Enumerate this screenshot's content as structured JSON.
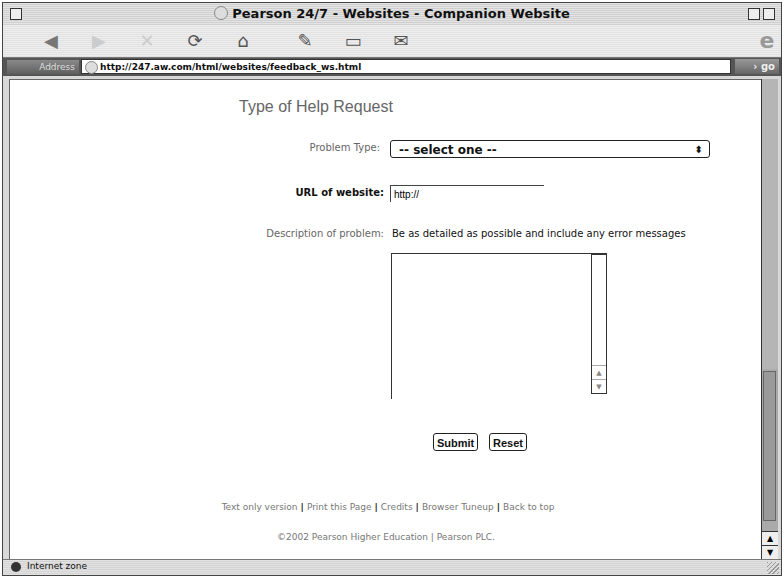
{
  "window": {
    "title": "Pearson 24/7 - Websites - Companion Website"
  },
  "toolbar": {
    "buttons": [
      {
        "name": "back",
        "icon": "back-arrow-icon",
        "glyph": "◀"
      },
      {
        "name": "forward",
        "icon": "forward-arrow-icon",
        "glyph": "▶"
      },
      {
        "name": "stop",
        "icon": "stop-x-icon",
        "glyph": "✕"
      },
      {
        "name": "refresh",
        "icon": "refresh-icon",
        "glyph": "⟳"
      },
      {
        "name": "home",
        "icon": "home-icon",
        "glyph": "⌂"
      },
      {
        "name": "autofill",
        "icon": "autofill-pen-icon",
        "glyph": "✎"
      },
      {
        "name": "print",
        "icon": "print-icon",
        "glyph": "▭"
      },
      {
        "name": "mail",
        "icon": "mail-icon",
        "glyph": "✉"
      }
    ],
    "brand_glyph": "e"
  },
  "address_bar": {
    "label": "Address",
    "url": "http://247.aw.com/html/websites/feedback_ws.html",
    "go_label": "› go"
  },
  "page": {
    "heading": "Type of Help Request",
    "problem_type": {
      "label": "Problem Type:",
      "selected": "-- select one --"
    },
    "url_field": {
      "label": "URL of website:",
      "value": "http://"
    },
    "description": {
      "label": "Description of problem:",
      "hint": "Be as detailed as possible and include any error messages",
      "value": ""
    },
    "buttons": {
      "submit": "Submit",
      "reset": "Reset"
    },
    "footer_links": [
      "Text only version",
      "Print this Page",
      "Credits",
      "Browser Tuneup",
      "Back to top"
    ],
    "footer_separator": "|",
    "copyright": "©2002 Pearson Higher Education | Pearson PLC."
  },
  "status_bar": {
    "zone": "Internet zone"
  }
}
